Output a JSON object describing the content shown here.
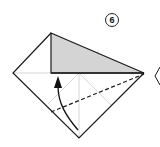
{
  "diagram": {
    "step_number": "6",
    "colors": {
      "paper": "#ffffff",
      "outline": "#1a1a1a",
      "shaded_flap": "#d4d4d4",
      "crease": "#bdbdbd",
      "arrow": "#111111"
    },
    "elements": {
      "square_outline": "diamond-shaped folded paper",
      "shaded_flap": "triangular flap folded up, shaded gray",
      "valley_fold_line": "dashed diagonal from lower-left edge to right corner",
      "fold_arrow": "curved arrow from bottom corner up toward flap",
      "next_step_hint": "partial diamond at right edge"
    }
  }
}
